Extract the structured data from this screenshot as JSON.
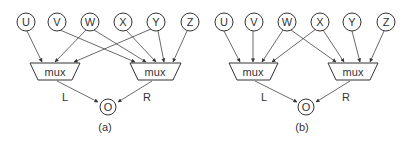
{
  "diagrams": [
    {
      "caption": "(a)",
      "inputs": [
        "U",
        "V",
        "W",
        "X",
        "Y",
        "Z"
      ],
      "mux_left": {
        "label": "mux",
        "out_label": "L",
        "inputs": [
          "U",
          "W",
          "Y"
        ]
      },
      "mux_right": {
        "label": "mux",
        "out_label": "R",
        "inputs": [
          "V",
          "W",
          "X",
          "Y",
          "Z"
        ]
      },
      "output": "O"
    },
    {
      "caption": "(b)",
      "inputs": [
        "U",
        "V",
        "W",
        "X",
        "Y",
        "Z"
      ],
      "mux_left": {
        "label": "mux",
        "out_label": "L",
        "inputs": [
          "U",
          "V",
          "W",
          "X"
        ]
      },
      "mux_right": {
        "label": "mux",
        "out_label": "R",
        "inputs": [
          "W",
          "X",
          "Y",
          "Z"
        ]
      },
      "output": "O"
    }
  ]
}
